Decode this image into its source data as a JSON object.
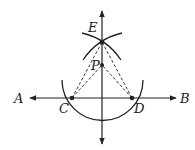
{
  "diagram": {
    "labels": {
      "A": "A",
      "B": "B",
      "C": "C",
      "D": "D",
      "E": "E",
      "P": "P"
    },
    "points": {
      "A": [
        28,
        98
      ],
      "B": [
        178,
        98
      ],
      "C": [
        72,
        98
      ],
      "D": [
        132,
        98
      ],
      "E": [
        102,
        42
      ],
      "P": [
        102,
        65
      ]
    },
    "colors": {
      "stroke": "#222222",
      "background": "#ffffff"
    }
  }
}
